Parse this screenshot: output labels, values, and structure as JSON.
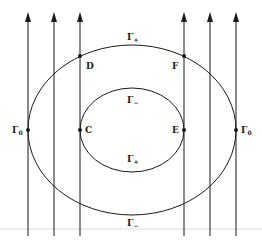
{
  "diagram": {
    "colors": {
      "stroke": "#1a1a1a",
      "baseline": "#d8d8d8",
      "background": "#ffffff"
    },
    "vertical_lines": [
      {
        "x": 28
      },
      {
        "x": 54
      },
      {
        "x": 80
      },
      {
        "x": 184
      },
      {
        "x": 210
      },
      {
        "x": 236
      }
    ],
    "outer_curve": {
      "cx": 132,
      "cy": 130,
      "rx": 104,
      "ry": 85
    },
    "inner_curve": {
      "cx": 132,
      "cy": 130,
      "rx": 52,
      "ry": 42
    },
    "points": [
      {
        "name": "Gamma0-left",
        "label": "Γ",
        "sub": "0",
        "x": 28,
        "y": 130
      },
      {
        "name": "C",
        "label": "C",
        "x": 80,
        "y": 130
      },
      {
        "name": "E",
        "label": "E",
        "x": 184,
        "y": 130
      },
      {
        "name": "Gamma0-right",
        "label": "Γ",
        "sub": "0",
        "x": 236,
        "y": 130
      },
      {
        "name": "D",
        "label": "D",
        "x": 80,
        "y": 56
      },
      {
        "name": "F",
        "label": "F",
        "x": 184,
        "y": 56
      }
    ],
    "labels": {
      "outer_top": {
        "main": "Γ",
        "sub": "+"
      },
      "inner_top": {
        "main": "Γ",
        "sub": "−"
      },
      "inner_bottom": {
        "main": "Γ",
        "sub": "+"
      },
      "outer_bottom": {
        "main": "Γ",
        "sub": "−"
      },
      "point_D": "D",
      "point_F": "F",
      "point_C": "C",
      "point_E": "E",
      "gamma0_left": {
        "main": "Γ",
        "sub": "0"
      },
      "gamma0_right": {
        "main": "Γ",
        "sub": "0"
      }
    }
  }
}
